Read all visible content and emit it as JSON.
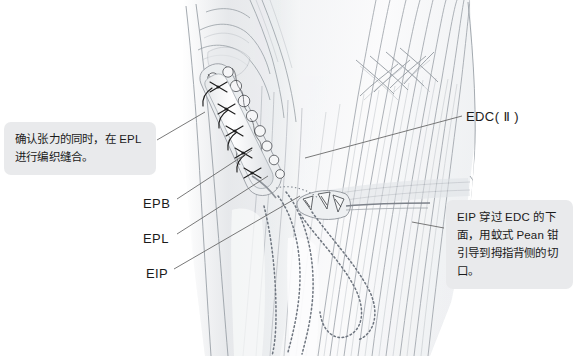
{
  "figure": {
    "kind": "medical-illustration",
    "background_color": "#ffffff"
  },
  "callouts": [
    {
      "id": "left",
      "text": "确认张力的同时，在 EPL 进行编织缝合。",
      "bg_color": "#e9eaec",
      "text_color": "#1b1b1b"
    },
    {
      "id": "right",
      "text": "EIP 穿过 EDC 的下面，用蚊式 Pean 钳引导到拇指背侧的切口。",
      "bg_color": "#e9eaec",
      "text_color": "#1b1b1b"
    }
  ],
  "labels": {
    "edc": "EDC( Ⅱ )",
    "epb": "EPB",
    "epl": "EPL",
    "eip": "EIP"
  },
  "leader_lines": {
    "color": "#6a6a6a",
    "width": 0.9
  },
  "artwork": {
    "line_color": "#8e9298",
    "shade_color": "#c9ccd1",
    "tendon_color": "#fbfbfc",
    "suture_color": "#2a2a2a",
    "dotted_path_color": "#707884"
  }
}
